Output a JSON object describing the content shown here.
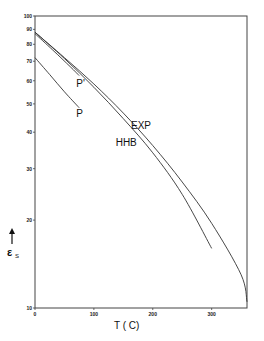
{
  "chart_data": {
    "type": "line",
    "title": "",
    "xlabel": "T ( C)",
    "ylabel": "ε_s",
    "ylabel_symbol": "ε",
    "ylabel_subscript": "s",
    "xlim": [
      0,
      360
    ],
    "ylim": [
      10,
      100
    ],
    "yscale": "log",
    "grid": false,
    "legend": "none (inline curve labels)",
    "x_ticks": [
      0,
      100,
      200,
      300
    ],
    "x_tick_labels": [
      "0",
      "100",
      "200",
      "300"
    ],
    "y_ticks": [
      10,
      20,
      30,
      40,
      50,
      60,
      70,
      80,
      90,
      100
    ],
    "y_tick_labels": [
      "10",
      "20",
      "30",
      "40",
      "50",
      "60",
      "70",
      "80",
      "90",
      "100"
    ],
    "series": [
      {
        "name": "EXP",
        "x": [
          0,
          50,
          100,
          150,
          200,
          250,
          300,
          350,
          360
        ],
        "y": [
          88,
          72,
          58.5,
          46.5,
          36,
          27,
          19.5,
          13,
          10.5
        ]
      },
      {
        "name": "HHB",
        "x": [
          0,
          50,
          100,
          150,
          200,
          250,
          300
        ],
        "y": [
          88,
          71.5,
          57,
          44.5,
          34,
          24.5,
          16
        ]
      },
      {
        "name": "P'",
        "x": [
          0,
          30,
          60,
          75
        ],
        "y": [
          87,
          76.5,
          67,
          62.5
        ]
      },
      {
        "name": "P",
        "x": [
          0,
          25,
          50,
          75
        ],
        "y": [
          72,
          63,
          55,
          48.5
        ]
      }
    ],
    "annotations": [
      {
        "text": "P'",
        "x": 70,
        "y": 57
      },
      {
        "text": "P",
        "x": 70,
        "y": 45
      },
      {
        "text": "EXP",
        "x": 163,
        "y": 41
      },
      {
        "text": "HHB",
        "x": 137,
        "y": 36
      }
    ]
  },
  "labels": {
    "x_axis": "T ( C)",
    "y_axis_symbol": "ε",
    "y_axis_sub": "S",
    "curve_p_prime": "P'",
    "curve_p": "P",
    "curve_exp": "EXP",
    "curve_hhb": "HHB"
  }
}
